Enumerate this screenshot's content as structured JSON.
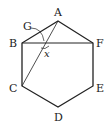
{
  "figure": {
    "shape": "regular hexagon",
    "vertices": [
      {
        "label": "A",
        "x": 58,
        "y": 21,
        "lx": 54,
        "ly": 16
      },
      {
        "label": "B",
        "x": 22,
        "y": 43,
        "lx": 9,
        "ly": 47
      },
      {
        "label": "C",
        "x": 22,
        "y": 86,
        "lx": 9,
        "ly": 92
      },
      {
        "label": "D",
        "x": 58,
        "y": 107,
        "lx": 54,
        "ly": 121
      },
      {
        "label": "E",
        "x": 93,
        "y": 86,
        "lx": 96,
        "ly": 92
      },
      {
        "label": "F",
        "x": 93,
        "y": 43,
        "lx": 96,
        "ly": 47
      }
    ],
    "diagonals": [
      {
        "from": "B",
        "to": "F"
      },
      {
        "from": "A",
        "to": "C"
      }
    ],
    "intersection": {
      "label": "G",
      "x": 44,
      "y": 43,
      "lx": 24,
      "ly": 29
    },
    "angle": {
      "label": "x",
      "lx": 44,
      "ly": 55
    },
    "stroke_color": "#222222"
  }
}
